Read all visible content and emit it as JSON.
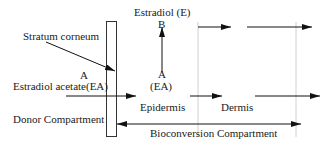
{
  "labels": {
    "estradiol": "Estradiol (E)",
    "b": "B",
    "stratum_corneum": "Stratum corneum",
    "a_left": "A",
    "estradiol_acetate": "Estradiol acetate(EA)",
    "a_center": "A",
    "ea_center": "(EA)",
    "epidermis": "Epidermis",
    "dermis": "Dermis",
    "donor_compartment": "Donor Compartment",
    "bioconversion_compartment": "Bioconversion Compartment"
  },
  "colors": {
    "line": "#111111",
    "divider": "#bdbdbd",
    "text": "#1a1a1a"
  }
}
